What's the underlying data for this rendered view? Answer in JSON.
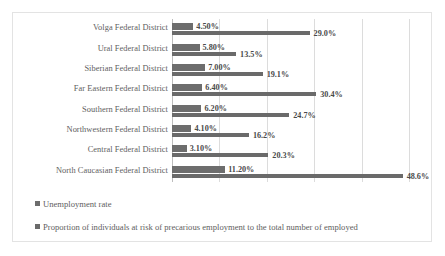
{
  "chart_data": {
    "type": "bar",
    "orientation": "horizontal",
    "grouped": true,
    "title": "",
    "xlabel": "",
    "ylabel": "",
    "xlim": [
      0,
      55
    ],
    "gridlines": [
      0,
      10,
      20,
      30,
      40,
      50
    ],
    "grid": true,
    "legend_position": "bottom-left",
    "categories": [
      "Volga Federal District",
      "Ural Federal District",
      "Siberian Federal District",
      "Far Eastern Federal District",
      "Southern Federal District",
      "Northwestern Federal District",
      "Central Federal District",
      "North Caucasian Federal District"
    ],
    "series": [
      {
        "name": "Unemployment rate",
        "color": "#6d6d6d",
        "values": [
          4.5,
          5.8,
          7.0,
          6.4,
          6.2,
          4.1,
          3.1,
          11.2
        ],
        "labels": [
          "4.50%",
          "5.80%",
          "7.00%",
          "6.40%",
          "6.20%",
          "4.10%",
          "3.10%",
          "11.20%"
        ]
      },
      {
        "name": "Proportion of individuals at risk of precarious employment to the total number of employed",
        "color": "#6a6a6a",
        "values": [
          29.0,
          13.5,
          19.1,
          30.4,
          24.7,
          16.2,
          20.3,
          48.6
        ],
        "labels": [
          "29.0%",
          "13.5%",
          "19.1%",
          "30.4%",
          "24.7%",
          "16.2%",
          "20.3%",
          "48.6%"
        ]
      }
    ]
  },
  "legend": {
    "items": [
      {
        "label": "Unemployment rate"
      },
      {
        "label": "Proportion of individuals at risk of precarious employment to the total number of employed"
      }
    ]
  }
}
